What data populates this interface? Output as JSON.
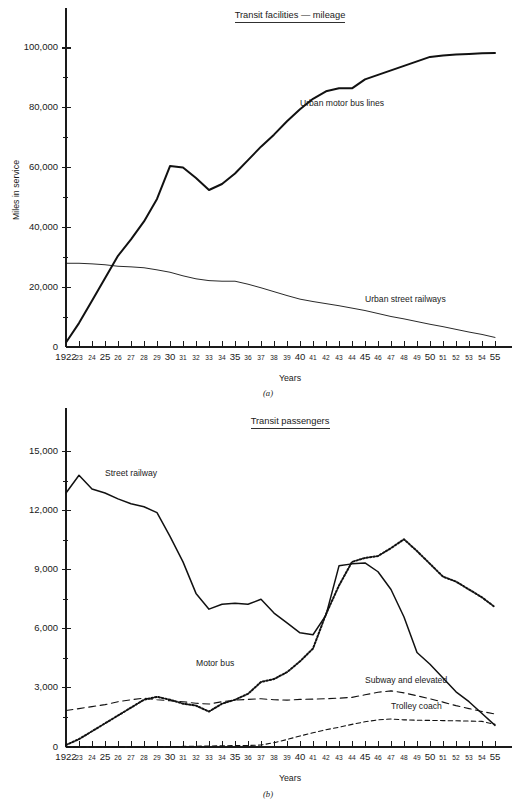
{
  "page": {
    "background": "#ffffff",
    "ink": "#111111"
  },
  "figures": [
    {
      "id": "a",
      "caption": "(a)",
      "title": "Transit facilities — mileage",
      "xlabel": "Years",
      "ylabel": "Miles in service"
    },
    {
      "id": "b",
      "caption": "(b)",
      "title": "Transit passengers",
      "xlabel": "Years",
      "ylabel": "Passengers  (millions)"
    }
  ],
  "x_axis": {
    "years": [
      1922,
      1923,
      1924,
      1925,
      1926,
      1927,
      1928,
      1929,
      1930,
      1931,
      1932,
      1933,
      1934,
      1935,
      1936,
      1937,
      1938,
      1939,
      1940,
      1941,
      1942,
      1943,
      1944,
      1945,
      1946,
      1947,
      1948,
      1949,
      1950,
      1951,
      1952,
      1953,
      1954,
      1955
    ],
    "tick_labels": [
      "1922",
      "23",
      "24",
      "25",
      "26",
      "27",
      "28",
      "29",
      "30",
      "31",
      "32",
      "33",
      "34",
      "35",
      "36",
      "37",
      "38",
      "39",
      "40",
      "41",
      "42",
      "43",
      "44",
      "45",
      "46",
      "47",
      "48",
      "49",
      "50",
      "51",
      "52",
      "53",
      "54",
      "55"
    ],
    "emphasized_labels": [
      "1922",
      "25",
      "30",
      "35",
      "40",
      "45",
      "50",
      "55"
    ],
    "range": [
      1922,
      1955
    ]
  },
  "chart_data": [
    {
      "type": "line",
      "title": "Transit facilities — mileage",
      "xlabel": "Years",
      "ylabel": "Miles in service",
      "ylim": [
        0,
        105000
      ],
      "y_ticks_labeled": [
        0,
        20000,
        40000,
        60000,
        80000,
        100000
      ],
      "y_tick_labels": [
        "0",
        "20,000",
        "40,000",
        "60,000",
        "80,000",
        "100,000"
      ],
      "y_ticks_minor": [
        10000,
        30000,
        50000,
        70000,
        90000
      ],
      "grid": false,
      "legend": "inline-annotations",
      "x": [
        1922,
        1923,
        1924,
        1925,
        1926,
        1927,
        1928,
        1929,
        1930,
        1931,
        1932,
        1933,
        1934,
        1935,
        1936,
        1937,
        1938,
        1939,
        1940,
        1941,
        1942,
        1943,
        1944,
        1945,
        1946,
        1947,
        1948,
        1949,
        1950,
        1951,
        1952,
        1953,
        1954,
        1955
      ],
      "series": [
        {
          "name": "Urban motor bus lines",
          "style": "solid-thick",
          "label_x": 1940,
          "label_y": 80500,
          "values": [
            1500,
            8000,
            15500,
            23000,
            30500,
            36000,
            42000,
            49500,
            60500,
            60000,
            56500,
            52500,
            54500,
            58000,
            62500,
            67000,
            71000,
            75500,
            79500,
            83000,
            85500,
            86500,
            86500,
            89500,
            91000,
            92500,
            94000,
            95500,
            97000,
            97500,
            97800,
            98000,
            98200,
            98300
          ]
        },
        {
          "name": "Urban street railways",
          "style": "solid-thin",
          "label_x": 1945,
          "label_y": 15200,
          "values": [
            28000,
            28000,
            27800,
            27500,
            27000,
            26800,
            26500,
            25800,
            25000,
            23800,
            22800,
            22200,
            22000,
            22000,
            21000,
            19800,
            18500,
            17200,
            16000,
            15200,
            14500,
            13800,
            13000,
            12200,
            11200,
            10200,
            9400,
            8500,
            7600,
            6800,
            5900,
            5000,
            4200,
            3200
          ]
        }
      ]
    },
    {
      "type": "line",
      "title": "Transit passengers",
      "xlabel": "Years",
      "ylabel": "Passengers  (millions)",
      "ylim": [
        0,
        16200
      ],
      "y_ticks_labeled": [
        0,
        3000,
        6000,
        9000,
        12000,
        15000
      ],
      "y_tick_labels": [
        "0",
        "3,000",
        "6,000",
        "9,000",
        "12,000",
        "15,000"
      ],
      "y_ticks_minor": [
        1500,
        4500,
        7500,
        10500,
        13500
      ],
      "grid": false,
      "legend": "inline-annotations",
      "x": [
        1922,
        1923,
        1924,
        1925,
        1926,
        1927,
        1928,
        1929,
        1930,
        1931,
        1932,
        1933,
        1934,
        1935,
        1936,
        1937,
        1938,
        1939,
        1940,
        1941,
        1942,
        1943,
        1944,
        1945,
        1946,
        1947,
        1948,
        1949,
        1950,
        1951,
        1952,
        1953,
        1954,
        1955
      ],
      "series": [
        {
          "name": "Street railway",
          "style": "solid-med",
          "label_x": 1925,
          "label_y": 13750,
          "values": [
            12900,
            13800,
            13100,
            12900,
            12600,
            12350,
            12200,
            11900,
            10700,
            9400,
            7800,
            7000,
            7250,
            7300,
            7250,
            7500,
            6800,
            6300,
            5800,
            5700,
            6700,
            9200,
            9300,
            9350,
            8900,
            8000,
            6600,
            4800,
            4200,
            3500,
            2800,
            2300,
            1700,
            1100
          ]
        },
        {
          "name": "Motor bus",
          "style": "dotted-thick",
          "label_x": 1932,
          "label_y": 4100,
          "values": [
            100,
            400,
            800,
            1200,
            1600,
            2000,
            2400,
            2550,
            2400,
            2200,
            2100,
            1800,
            2200,
            2400,
            2700,
            3300,
            3450,
            3800,
            4350,
            5000,
            6750,
            8200,
            9400,
            9600,
            9700,
            10100,
            10550,
            9950,
            9300,
            8650,
            8400,
            8000,
            7600,
            7100
          ]
        },
        {
          "name": "Subway and elevated",
          "style": "dashed-long",
          "label_x": 1945,
          "label_y": 3250,
          "values": [
            1850,
            1950,
            2050,
            2150,
            2300,
            2400,
            2480,
            2400,
            2350,
            2300,
            2220,
            2180,
            2300,
            2380,
            2420,
            2450,
            2400,
            2380,
            2420,
            2430,
            2450,
            2480,
            2520,
            2650,
            2780,
            2850,
            2750,
            2600,
            2450,
            2280,
            2100,
            1950,
            1800,
            1680
          ]
        },
        {
          "name": "Trolley coach",
          "style": "dashed-short",
          "label_x": 1947,
          "label_y": 1950,
          "values": [
            0,
            0,
            0,
            0,
            0,
            0,
            0,
            10,
            20,
            30,
            40,
            50,
            60,
            70,
            80,
            100,
            220,
            380,
            560,
            720,
            880,
            1000,
            1150,
            1280,
            1380,
            1420,
            1380,
            1360,
            1350,
            1340,
            1330,
            1320,
            1300,
            1150
          ]
        }
      ]
    }
  ]
}
